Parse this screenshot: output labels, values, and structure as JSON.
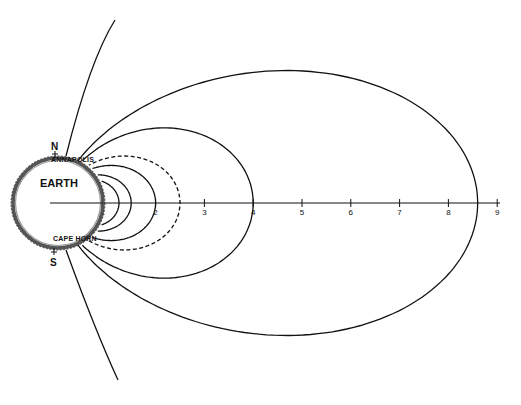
{
  "diagram": {
    "title": "",
    "earth_label": "EARTH",
    "north_label": "N",
    "south_label": "S",
    "north_place": "ANNAPOLIS",
    "south_place": "CAPE HORN",
    "axis": {
      "ticks": [
        "0",
        "1",
        "2",
        "3",
        "4",
        "5",
        "6",
        "7",
        "8",
        "9"
      ],
      "unit": "Earth radii",
      "range": [
        0,
        9
      ]
    },
    "field_lines": [
      {
        "name": "L-1.25",
        "equatorial_distance": 1.25,
        "style": "solid"
      },
      {
        "name": "L-1.5",
        "equatorial_distance": 1.5,
        "style": "solid"
      },
      {
        "name": "L-2",
        "equatorial_distance": 2.0,
        "style": "solid"
      },
      {
        "name": "L-2.5",
        "equatorial_distance": 2.5,
        "style": "dashed"
      },
      {
        "name": "L-4",
        "equatorial_distance": 4.0,
        "style": "solid"
      },
      {
        "name": "L-8.6",
        "equatorial_distance": 8.6,
        "style": "solid"
      }
    ],
    "open_lines": [
      {
        "name": "open-north",
        "hemisphere": "north"
      },
      {
        "name": "open-south",
        "hemisphere": "south"
      }
    ],
    "colors": {
      "ink": "#111111",
      "background": "#ffffff"
    }
  }
}
